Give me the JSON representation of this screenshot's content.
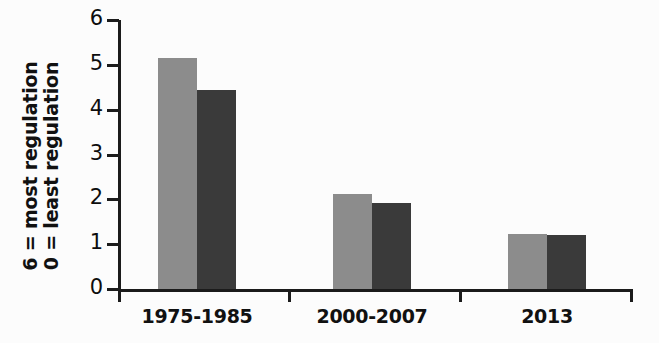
{
  "chart_data": {
    "type": "bar",
    "title": "",
    "subtitle": "",
    "xlabel": "",
    "ylabel": "6 = most regulation / 0 = least regulation",
    "ylabel_lines": [
      "6 = most regulation",
      "0 = least regulation"
    ],
    "categories": [
      "1975-1985",
      "2000-2007",
      "2013"
    ],
    "series": [
      {
        "name": "light-gray-series",
        "color": "#8c8c8c",
        "values": [
          5.15,
          2.13,
          1.23
        ]
      },
      {
        "name": "dark-gray-series",
        "color": "#3a3a3a",
        "values": [
          4.45,
          1.92,
          1.2
        ]
      }
    ],
    "ylim": [
      0,
      6
    ],
    "y_ticks": [
      0,
      1,
      2,
      3,
      4,
      5,
      6
    ],
    "y_tick_labels": [
      "0",
      "1",
      "2",
      "3",
      "4",
      "5",
      "6"
    ],
    "grid": false,
    "legend": "none",
    "legend_position": "none",
    "background_color": "#fcfcfc",
    "axis_color": "#1b1b1b"
  },
  "axis": {
    "y_title_line1": "6 = most regulation",
    "y_title_line2": "0 = least regulation"
  }
}
